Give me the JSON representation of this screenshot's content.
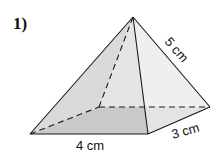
{
  "problem": {
    "number": "1)",
    "shape": "rectangular pyramid",
    "labels": {
      "slant_edge": "5 cm",
      "base_width": "4 cm",
      "base_depth": "3 cm"
    },
    "colors": {
      "base": "#8f8f8f",
      "left_face": "#d6d6d6",
      "front_face": "#e4e4e4",
      "right_face": "#f0f0f0",
      "edge": "#1a1a1a"
    }
  }
}
